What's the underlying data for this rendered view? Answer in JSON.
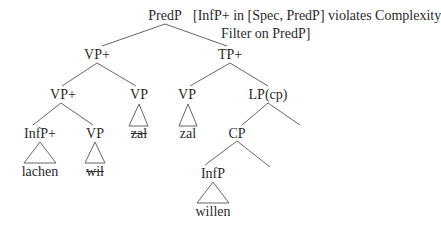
{
  "diagram": {
    "type": "syntax-tree",
    "annotation": {
      "line1": "[InfP+ in [Spec, PredP] violates Complexity",
      "line2": "Filter on PredP]"
    },
    "nodes": {
      "root": "PredP",
      "vp_plus_top": "VP+",
      "tp_plus": "TP+",
      "vp_plus_inner": "VP+",
      "vp_strike": "VP",
      "vp_zal": "VP",
      "lp_cp": "LP(cp)",
      "infp_plus": "InfP+",
      "vp_wil": "VP",
      "cp": "CP",
      "infp": "InfP"
    },
    "leaves": {
      "zal_struck": "zal",
      "zal": "zal",
      "lachen": "lachen",
      "wil_struck": "wil",
      "willen": "willen"
    },
    "line_color": "#4a4a4a"
  }
}
